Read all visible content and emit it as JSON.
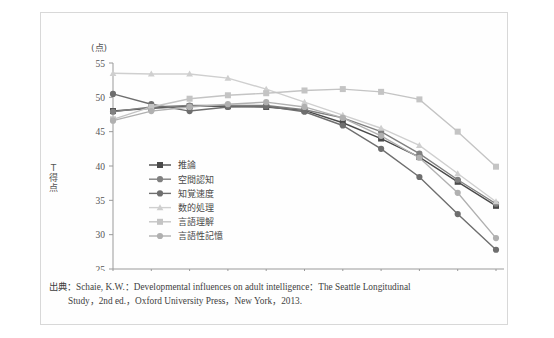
{
  "figure": {
    "y_axis_unit": "(点)",
    "y_axis_title": "T得点",
    "x_axis_unit": "(歳)",
    "x_axis_title": "年齢"
  },
  "source": {
    "line1": "出典：Schaie, K.W.：Developmental influences on adult intelligence：The Seattle Longitudinal",
    "line2": "Study，2nd ed.，Oxford University Press，New York，2013."
  },
  "chart_data": {
    "type": "line",
    "title": "",
    "xlabel": "年齢",
    "ylabel": "T得点",
    "xunit": "(歳)",
    "yunit": "(点)",
    "grid": false,
    "legend_position": "inside-left",
    "categories": [
      25,
      32,
      39,
      46,
      53,
      60,
      67,
      74,
      81,
      88,
      95
    ],
    "xlim": [
      25,
      95
    ],
    "ylim": [
      25,
      55
    ],
    "yticks": [
      25,
      30,
      35,
      40,
      45,
      50,
      55
    ],
    "xticks": [
      25,
      32,
      39,
      46,
      53,
      60,
      67,
      74,
      81,
      88,
      95
    ],
    "series": [
      {
        "name": "推論",
        "marker": "square",
        "color": "#4a4a4a",
        "values": [
          48.0,
          48.4,
          48.7,
          48.7,
          48.6,
          48.1,
          46.3,
          44.0,
          41.3,
          37.7,
          34.2
        ]
      },
      {
        "name": "空間認知",
        "marker": "circle",
        "color": "#808080",
        "values": [
          47.9,
          48.6,
          48.8,
          48.8,
          48.8,
          48.2,
          47.0,
          45.0,
          41.8,
          38.0,
          34.5
        ]
      },
      {
        "name": "知覚速度",
        "marker": "circle",
        "color": "#6e6e6e",
        "values": [
          50.5,
          49.0,
          48.0,
          48.6,
          48.7,
          47.9,
          45.9,
          42.5,
          38.4,
          33.0,
          27.8
        ]
      },
      {
        "name": "数的処理",
        "marker": "triangle",
        "color": "#cfcfcf",
        "values": [
          53.5,
          53.4,
          53.4,
          52.8,
          51.2,
          49.3,
          47.4,
          45.5,
          43.0,
          38.9,
          34.8
        ]
      },
      {
        "name": "言語理解",
        "marker": "square",
        "color": "#c4c4c4",
        "values": [
          46.8,
          48.6,
          49.8,
          50.3,
          50.6,
          51.0,
          51.2,
          50.8,
          49.7,
          45.0,
          39.9
        ]
      },
      {
        "name": "言語性記憶",
        "marker": "circle",
        "color": "#b0b0b0",
        "values": [
          46.6,
          48.0,
          48.6,
          49.0,
          49.3,
          48.6,
          47.0,
          44.4,
          41.2,
          36.1,
          29.5
        ]
      }
    ]
  }
}
